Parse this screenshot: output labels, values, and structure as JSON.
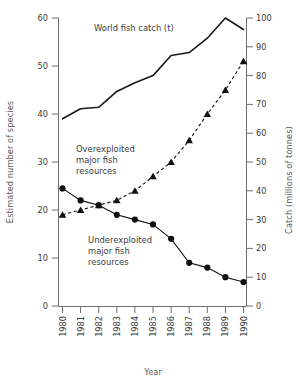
{
  "chart_data": {
    "type": "line",
    "title": "",
    "xlabel": "Year",
    "ylabel": "Estimated number of species",
    "y2label": "Catch (millions of tonnes)",
    "x": [
      1980,
      1981,
      1982,
      1983,
      1984,
      1985,
      1986,
      1987,
      1988,
      1989,
      1990
    ],
    "categories": [
      "1980",
      "1981",
      "1982",
      "1983",
      "1984",
      "1985",
      "1986",
      "1987",
      "1988",
      "1989",
      "1990"
    ],
    "xlim": [
      1980,
      1990
    ],
    "ylim": [
      0,
      60
    ],
    "y2lim": [
      0,
      100
    ],
    "yticks": [
      0,
      10,
      20,
      30,
      40,
      50,
      60
    ],
    "y2ticks": [
      0,
      10,
      20,
      30,
      40,
      50,
      60,
      70,
      80,
      90,
      100
    ],
    "grid": false,
    "legend_position": "inline-annotations",
    "series": [
      {
        "name": "World fish catch (t)",
        "axis": "right",
        "style": "solid-line",
        "marker": "none",
        "color": "#1a1a1a",
        "values": [
          65,
          68.5,
          69,
          74.5,
          77.5,
          80,
          87,
          88,
          93,
          100,
          96
        ]
      },
      {
        "name": "Overexploited major fish resources",
        "axis": "left",
        "style": "dashed-line",
        "marker": "triangle",
        "color": "#111111",
        "values": [
          19,
          20,
          21,
          22,
          24,
          27,
          30,
          34.5,
          40,
          45,
          51
        ]
      },
      {
        "name": "Underexploited major fish resources",
        "axis": "left",
        "style": "solid-line",
        "marker": "circle",
        "color": "#111111",
        "values": [
          24.5,
          22,
          21,
          19,
          18,
          17,
          14,
          9,
          8,
          6,
          5
        ]
      }
    ],
    "annotations": [
      {
        "id": "catch-label",
        "text": "World fish catch (t)"
      },
      {
        "id": "overexploited-label",
        "lines": [
          "Overexploited",
          "major fish",
          "resources"
        ]
      },
      {
        "id": "underexploited-label",
        "lines": [
          "Underexploited",
          "major fish",
          "resources"
        ]
      }
    ]
  },
  "axes": {
    "x_title": "Year",
    "y_left_title": "Estimated number of species",
    "y_right_title": "Catch (millions of tonnes)",
    "y_left_ticks": [
      "0",
      "10",
      "20",
      "30",
      "40",
      "50",
      "60"
    ],
    "y_right_ticks": [
      "0",
      "10",
      "20",
      "30",
      "40",
      "50",
      "60",
      "70",
      "80",
      "90",
      "100"
    ],
    "x_ticks": [
      "1980",
      "1981",
      "1982",
      "1983",
      "1984",
      "1985",
      "1986",
      "1987",
      "1988",
      "1989",
      "1990"
    ]
  },
  "labels": {
    "catch": "World fish catch (t)",
    "over_1": "Overexploited",
    "over_2": "major fish",
    "over_3": "resources",
    "under_1": "Underexploited",
    "under_2": "major fish",
    "under_3": "resources"
  },
  "colors": {
    "ink": "#1a1a1a",
    "axis": "#6d6d6d",
    "text": "#3b3b3b",
    "background": "#ffffff"
  }
}
